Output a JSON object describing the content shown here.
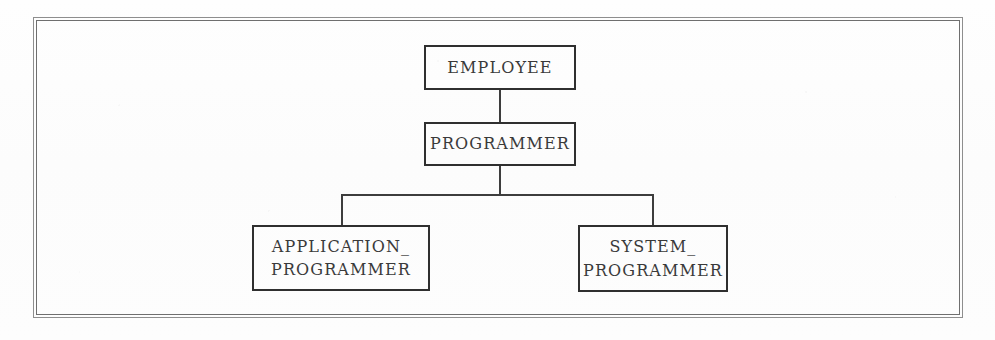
{
  "diagram": {
    "type": "specialization-hierarchy",
    "frame": {
      "style": "double-ruled-rectangle"
    },
    "nodes": [
      {
        "id": "employee",
        "label": "EMPLOYEE",
        "level": 0
      },
      {
        "id": "programmer",
        "label": "PROGRAMMER",
        "level": 1
      },
      {
        "id": "application_programmer",
        "label": "APPLICATION_\nPROGRAMMER",
        "level": 2
      },
      {
        "id": "system_programmer",
        "label": "SYSTEM_\nPROGRAMMER",
        "level": 2
      }
    ],
    "edges": [
      {
        "from": "employee",
        "to": "programmer"
      },
      {
        "from": "programmer",
        "to": "application_programmer"
      },
      {
        "from": "programmer",
        "to": "system_programmer"
      }
    ],
    "colors": {
      "background": "#fdfdfd",
      "box_border": "#2f2f2f",
      "connector": "#3d3d3d",
      "frame": "#8e8e8e",
      "text": "#3a3a3a"
    }
  }
}
